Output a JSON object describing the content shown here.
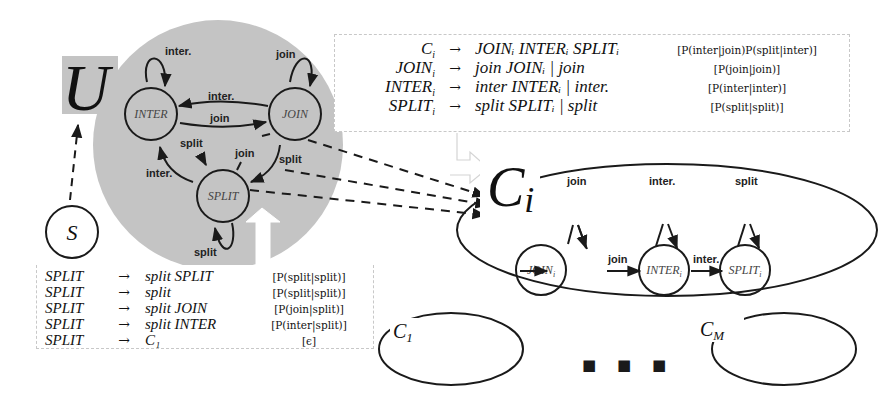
{
  "universe": {
    "label": "U",
    "start_state": "S",
    "states": [
      {
        "id": "inter",
        "label": "INTER"
      },
      {
        "id": "join",
        "label": "JOIN"
      },
      {
        "id": "split",
        "label": "SPLIT"
      }
    ],
    "edges": {
      "inter_self": "inter.",
      "join_self": "join",
      "join_to_inter": "inter.",
      "inter_to_join": "join",
      "inter_to_split": "split",
      "split_to_join": "join",
      "join_to_split": "split",
      "split_to_inter": "inter.",
      "split_self": "split"
    }
  },
  "cluster_rules": {
    "rows": [
      {
        "lhs": "C",
        "lhs_sub": "i",
        "rhs": "JOINᵢ INTERᵢ SPLITᵢ",
        "prob": "[P(inter|join)P(split|inter)]"
      },
      {
        "lhs": "JOIN",
        "lhs_sub": "i",
        "rhs": "join JOINᵢ | join",
        "prob": "[P(join|join)]"
      },
      {
        "lhs": "INTER",
        "lhs_sub": "i",
        "rhs": "inter INTERᵢ | inter.",
        "prob": "[P(inter|inter)]"
      },
      {
        "lhs": "SPLIT",
        "lhs_sub": "i",
        "rhs": "split SPLITᵢ | split",
        "prob": "[P(split|split)]"
      }
    ]
  },
  "split_rules": {
    "rows": [
      {
        "lhs": "SPLIT",
        "rhs": "split SPLIT",
        "prob": "[P(split|split)]"
      },
      {
        "lhs": "SPLIT",
        "rhs": "split",
        "prob": "[P(split|split)]"
      },
      {
        "lhs": "SPLIT",
        "rhs": "split JOIN",
        "prob": "[P(join|split)]"
      },
      {
        "lhs": "SPLIT",
        "rhs": "split INTER",
        "prob": "[P(inter|split)]"
      },
      {
        "lhs": "SPLIT",
        "rhs": "C₁",
        "prob": "[ϵ]"
      }
    ]
  },
  "cluster": {
    "label": "C",
    "label_sub": "i",
    "states": [
      {
        "label": "JOIN",
        "sub": "i",
        "self_label": "join"
      },
      {
        "label": "INTER",
        "sub": "i",
        "self_label": "inter."
      },
      {
        "label": "SPLIT",
        "sub": "i",
        "self_label": "split"
      }
    ],
    "transitions": [
      "join",
      "inter."
    ]
  },
  "other_clusters": [
    {
      "label": "C",
      "sub": "1"
    },
    {
      "label": "C",
      "sub": "M"
    }
  ],
  "ellipsis": "■ ■ ■",
  "arrow_symbol": "→",
  "colors": {
    "universe_fill": "#c4c4c4",
    "stroke": "#1a1a1a",
    "box_border": "#c8c8c8"
  }
}
